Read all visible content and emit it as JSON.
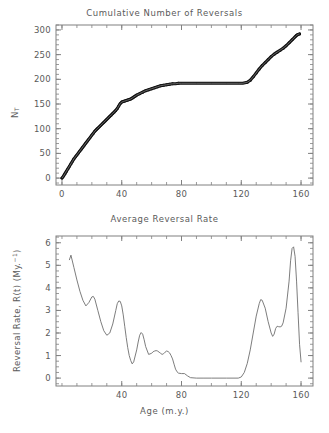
{
  "figure": {
    "background": "#ffffff",
    "axis_color": "#808080",
    "data_color": "#111111"
  },
  "panels": [
    {
      "id": "cumulative",
      "title": "Cumulative Number of Reversals",
      "ylabel_main": "N",
      "ylabel_sub": "T",
      "xlabel": ""
    },
    {
      "id": "rate",
      "title": "Average Reversal Rate",
      "ylabel_main": "Reversal Rate, R(t) (My.",
      "ylabel_sup": "−1",
      "ylabel_tail": ")",
      "xlabel": "Age (m.y.)"
    }
  ],
  "chart_data": [
    {
      "type": "line",
      "title": "Cumulative Number of Reversals",
      "xlabel": "",
      "ylabel": "N_T",
      "xlim": [
        -4,
        168
      ],
      "ylim": [
        -14,
        310
      ],
      "xticks": [
        0,
        40,
        80,
        120,
        160
      ],
      "yticks": [
        0,
        50,
        100,
        150,
        200,
        250,
        300
      ],
      "xminor_step": 10,
      "yminor_step": 10,
      "grid": false,
      "legend": null,
      "annotations": [
        "Flat plateau between ~83 and ~121 m.y. is the Cretaceous Normal Superchron (no reversals)"
      ],
      "series": [
        {
          "name": "Cumulative reversals N_T(t)",
          "style": "thick-black-staircase",
          "x": [
            0,
            1,
            2,
            3,
            4,
            5,
            6,
            7,
            8,
            9,
            10,
            11,
            12,
            13,
            14,
            15,
            16,
            17,
            18,
            19,
            20,
            21,
            22,
            23,
            24,
            25,
            26,
            27,
            28,
            29,
            30,
            31,
            32,
            33,
            34,
            35,
            36,
            37,
            38,
            39,
            40,
            41,
            42,
            43,
            44,
            45,
            46,
            47,
            48,
            49,
            50,
            52,
            54,
            56,
            58,
            60,
            62,
            64,
            66,
            68,
            70,
            72,
            74,
            76,
            78,
            80,
            83,
            90,
            100,
            110,
            118,
            121,
            124,
            126,
            128,
            130,
            132,
            134,
            136,
            138,
            140,
            142,
            144,
            146,
            148,
            150,
            152,
            154,
            156,
            157,
            158,
            159
          ],
          "y": [
            0,
            4,
            9,
            14,
            19,
            24,
            29,
            34,
            39,
            43,
            47,
            51,
            55,
            59,
            63,
            67,
            71,
            75,
            79,
            83,
            87,
            91,
            95,
            98,
            101,
            104,
            107,
            110,
            113,
            116,
            119,
            122,
            125,
            128,
            131,
            134,
            137,
            141,
            146,
            151,
            154,
            155,
            156,
            157,
            158,
            159,
            160,
            162,
            164,
            166,
            168,
            171,
            174,
            177,
            179,
            181,
            183,
            185,
            187,
            188,
            189,
            190,
            191,
            191,
            192,
            192,
            192,
            192,
            192,
            192,
            192,
            192,
            194,
            198,
            205,
            213,
            221,
            228,
            234,
            240,
            246,
            251,
            255,
            259,
            263,
            268,
            274,
            280,
            286,
            289,
            291,
            292
          ]
        }
      ]
    },
    {
      "type": "line",
      "title": "Average Reversal Rate",
      "xlabel": "Age (m.y.)",
      "ylabel": "Reversal Rate, R(t) (My.^-1)",
      "xlim": [
        -4,
        168
      ],
      "ylim": [
        -0.35,
        6.3
      ],
      "xticks": [
        40,
        80,
        120,
        160
      ],
      "yticks": [
        0,
        1,
        2,
        3,
        4,
        5,
        6
      ],
      "xminor_step": 10,
      "yminor_step": 0.25,
      "grid": false,
      "legend": null,
      "annotations": [
        "Rate drops to zero across the Cretaceous Normal Superchron (~83-121 m.y.)",
        "Peak rate ~5.8 My^-1 near 154 m.y."
      ],
      "series": [
        {
          "name": "Average reversal rate R(t)",
          "style": "thin-gray-smooth",
          "x": [
            5,
            6,
            8,
            10,
            12,
            14,
            16,
            18,
            20,
            21,
            22,
            24,
            26,
            28,
            30,
            32,
            34,
            36,
            37,
            38,
            39,
            40,
            41,
            42,
            43,
            44,
            45,
            46,
            47,
            48,
            50,
            51,
            52,
            53,
            54,
            55,
            56,
            58,
            60,
            61,
            62,
            63,
            64,
            65,
            66,
            67,
            68,
            69,
            70,
            71,
            72,
            73,
            74,
            75,
            76,
            77,
            78,
            80,
            82,
            84,
            86,
            90,
            95,
            100,
            110,
            118,
            120,
            122,
            124,
            126,
            128,
            130,
            132,
            133,
            134,
            136,
            138,
            140,
            141,
            142,
            143,
            144,
            145,
            146,
            147,
            148,
            150,
            152,
            153,
            154,
            155,
            156,
            157,
            158,
            159,
            160
          ],
          "y": [
            5.25,
            5.45,
            4.9,
            4.35,
            3.85,
            3.45,
            3.2,
            3.35,
            3.6,
            3.62,
            3.5,
            3.0,
            2.5,
            2.1,
            1.9,
            2.0,
            2.4,
            3.0,
            3.3,
            3.42,
            3.4,
            3.2,
            2.8,
            2.3,
            1.8,
            1.35,
            1.0,
            0.78,
            0.63,
            0.72,
            1.25,
            1.6,
            1.9,
            2.02,
            1.95,
            1.7,
            1.4,
            1.05,
            1.1,
            1.17,
            1.2,
            1.22,
            1.2,
            1.15,
            1.1,
            1.05,
            1.08,
            1.15,
            1.2,
            1.18,
            1.12,
            1.0,
            0.85,
            0.62,
            0.4,
            0.28,
            0.22,
            0.2,
            0.2,
            0.1,
            0.02,
            0.0,
            0.0,
            0.0,
            0.0,
            0.0,
            0.05,
            0.25,
            0.65,
            1.25,
            2.0,
            2.75,
            3.3,
            3.48,
            3.45,
            3.1,
            2.5,
            2.0,
            1.85,
            1.95,
            2.2,
            2.3,
            2.28,
            2.27,
            2.3,
            2.45,
            3.1,
            4.3,
            5.2,
            5.75,
            5.82,
            5.4,
            4.3,
            2.9,
            1.5,
            0.72
          ]
        }
      ]
    }
  ]
}
